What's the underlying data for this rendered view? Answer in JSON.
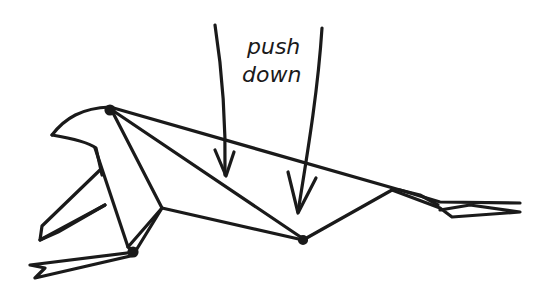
{
  "diagram": {
    "type": "origami-folding-step",
    "annotation": {
      "line1": "push",
      "line2": "down"
    },
    "arrows": [
      {
        "name": "push-arrow-left",
        "direction": "down"
      },
      {
        "name": "push-arrow-right",
        "direction": "down"
      }
    ],
    "stroke_color": "#1a1a1a",
    "background": "#ffffff"
  }
}
